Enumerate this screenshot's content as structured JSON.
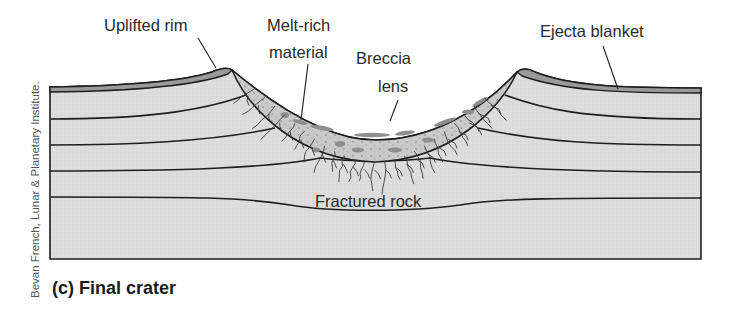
{
  "figure": {
    "caption": "(c) Final crater",
    "credit": "Bevan French, Lunar & Planetary Institute.",
    "labels": {
      "uplifted_rim": "Uplifted rim",
      "melt_rich_line1": "Melt-rich",
      "melt_rich_line2": "material",
      "breccia_line1": "Breccia",
      "breccia_line2": "lens",
      "ejecta_blanket": "Ejecta blanket",
      "fractured_rock": "Fractured rock"
    },
    "colors": {
      "rock": "#dcdcdc",
      "ejecta": "#9a9a9a",
      "lens": "#c8c8c8",
      "melt": "#8e8e8e",
      "line": "#1e1e1e",
      "fracture": "#3a3a3a"
    }
  }
}
